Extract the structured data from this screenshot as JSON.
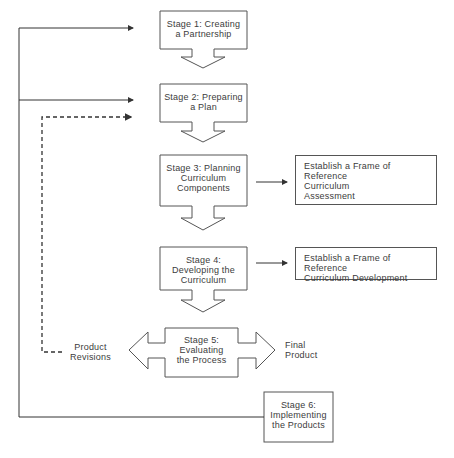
{
  "stages": [
    {
      "id": 1,
      "label": "Stage 1: Creating\na Partnership"
    },
    {
      "id": 2,
      "label": "Stage 2: Preparing\na Plan"
    },
    {
      "id": 3,
      "label": "Stage 3: Planning\nCurriculum\nComponents"
    },
    {
      "id": 4,
      "label": "Stage 4:\nDeveloping the\nCurriculum"
    },
    {
      "id": 5,
      "label": "Stage 5:\nEvaluating\nthe Process"
    },
    {
      "id": 6,
      "label": "Stage 6:\nImplementing\nthe Products"
    }
  ],
  "reference_boxes": [
    {
      "label": "Establish a Frame of Reference\nCurriculum\nAssessment"
    },
    {
      "label": "Establish a Frame of Reference\nCurriculum Development"
    }
  ],
  "outcomes": {
    "revisions": "Product\nRevisions",
    "final": "Final\nProduct"
  },
  "colors": {
    "stroke": "#555555",
    "text": "#3c3c3c",
    "fill": "#ffffff"
  }
}
